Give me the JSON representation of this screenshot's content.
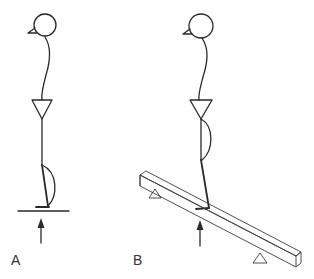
{
  "panels": [
    {
      "id": "A",
      "label": "A",
      "description": "Stick figure standing on a flat horizontal surface with upward ground reaction force arrow"
    },
    {
      "id": "B",
      "label": "B",
      "description": "Stick figure standing on an inclined beam supported by two triangular fulcrums with upward force arrow"
    }
  ],
  "colors": {
    "stroke": "#2a2a2a",
    "background": "#ffffff",
    "label": "#333333"
  }
}
